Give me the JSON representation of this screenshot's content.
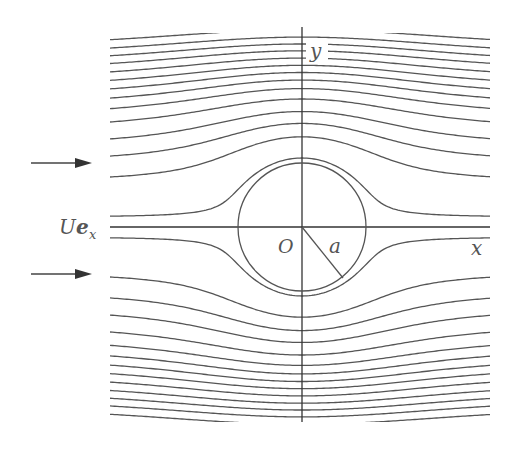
{
  "figure": {
    "kind": "uniform flow past a circular cylinder (streamlines)",
    "labels": {
      "y_axis": "y",
      "x_axis": "x",
      "origin": "O",
      "radius": "a",
      "free_stream_U": "U",
      "free_stream_e": "e",
      "free_stream_sub": "x"
    },
    "colors": {
      "line": "#555555",
      "axis": "#333333",
      "arrow": "#333333",
      "background": "#ffffff"
    }
  },
  "chart_data": {
    "type": "line",
    "title": "",
    "cylinder_radius": 1,
    "xlim": [
      -3,
      3
    ],
    "ylim": [
      -3.05,
      3.05
    ],
    "stream_function_values_upper": [
      0.15,
      0.7,
      1.0,
      1.25,
      1.5,
      1.7,
      1.86,
      2.0,
      2.13,
      2.26,
      2.39,
      2.51,
      2.63,
      2.76,
      2.9
    ],
    "stream_function_values_lower": [
      -0.15,
      -0.7,
      -1.0,
      -1.25,
      -1.5,
      -1.7,
      -1.86,
      -2.0,
      -2.13,
      -2.26,
      -2.39,
      -2.51,
      -2.63,
      -2.76,
      -2.9
    ],
    "dividing_streamline": 0,
    "free_stream_arrows": 2,
    "xlabel": "x",
    "ylabel": "y",
    "grid": false,
    "legend": "none"
  }
}
